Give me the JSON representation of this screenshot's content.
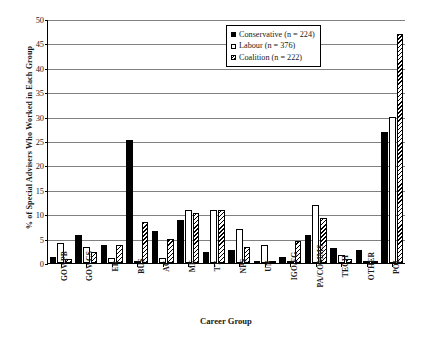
{
  "chart_data": {
    "type": "bar",
    "title": "",
    "xlabel": "Career Group",
    "ylabel": "% of Special Advisers Who Worked in Each Group",
    "ylim": [
      0,
      50
    ],
    "ytick_step": 5,
    "yticks": [
      0,
      5,
      10,
      15,
      20,
      25,
      30,
      35,
      40,
      45,
      50
    ],
    "grid": true,
    "legend_position": "top-right",
    "categories": [
      "GOV-PB",
      "GOV-CS",
      "ER",
      "BUS",
      "AC",
      "ME",
      "TT",
      "NPS",
      "UN",
      "IGO/FG",
      "PA/COMMS",
      "TECH",
      "OTHER",
      "POL"
    ],
    "series": [
      {
        "name": "Conservative (n = 224)",
        "fill": "solid-black",
        "values": [
          1.3,
          5.8,
          3.6,
          25.3,
          6.5,
          8.9,
          2.2,
          2.7,
          0.4,
          1.3,
          5.8,
          3.1,
          2.7,
          26.8
        ]
      },
      {
        "name": "Labour (n = 376)",
        "fill": "white",
        "values": [
          4.0,
          3.2,
          1.1,
          0.3,
          1.0,
          10.9,
          10.9,
          7.0,
          3.7,
          0.5,
          11.8,
          1.6,
          0.5,
          30.0
        ]
      },
      {
        "name": "Coalition (n = 222)",
        "fill": "hatched",
        "values": [
          0.9,
          2.3,
          3.6,
          8.5,
          5.0,
          10.3,
          10.8,
          3.2,
          0.5,
          4.5,
          9.2,
          0.8,
          0.5,
          47.0
        ]
      }
    ]
  },
  "legend": {
    "items": [
      {
        "label": "Conservative (n = 224)"
      },
      {
        "label": "Labour (n = 376)"
      },
      {
        "label": "Coalition (n = 222)"
      }
    ]
  }
}
